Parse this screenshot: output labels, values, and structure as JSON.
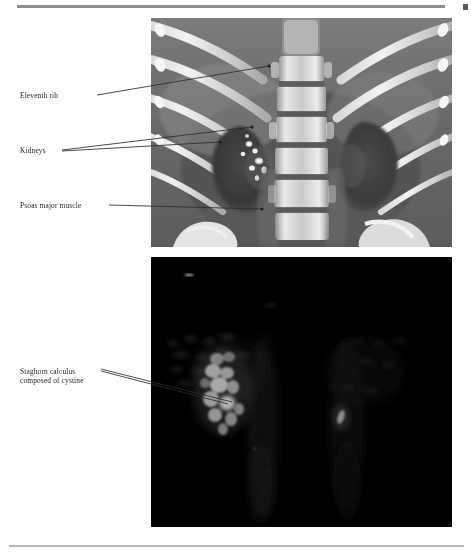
{
  "figure": {
    "type": "medical-imaging-figure",
    "modality": "Computed tomography",
    "views": [
      {
        "id": "ct-coronal",
        "description": "Coronal CT reconstruction of the abdomen showing ribs, lumbar spine, kidneys and psoas muscles",
        "background_tone": "#6e6e6e"
      },
      {
        "id": "volume-rendering",
        "description": "Dark volume-rendered / maximum intensity projection showing a bright staghorn calculus in the right renal collecting system",
        "background_tone": "#000000"
      }
    ]
  },
  "labels": [
    {
      "id": "eleventh-rib",
      "text": "Eleventh rib",
      "panel": "ct-coronal",
      "leaders": 1
    },
    {
      "id": "kidneys",
      "text": "Kidneys",
      "panel": "ct-coronal",
      "leaders": 2
    },
    {
      "id": "psoas-major-muscle",
      "text": "Psoas major muscle",
      "panel": "ct-coronal",
      "leaders": 1
    },
    {
      "id": "staghorn-calculus",
      "text": "Staghorn calculus\ncomposed of cystine",
      "panel": "volume-rendering",
      "leaders": 2
    }
  ],
  "rules": {
    "top_color": "#8e8e8e",
    "bottom_color": "#b6b6b6",
    "corner_mark_color": "#5a5a5a"
  },
  "leader_line_color": "#2b2b2b"
}
